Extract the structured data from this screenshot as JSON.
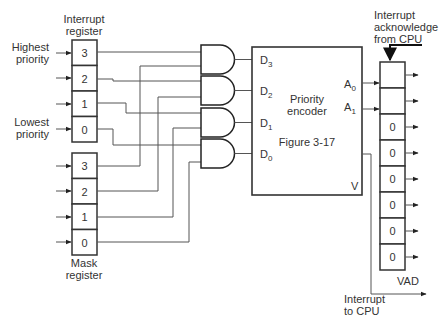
{
  "figure": {
    "caption": "Figure 3-17"
  },
  "interrupt_register": {
    "title_line1": "Interrupt",
    "title_line2": "register",
    "cells": [
      "3",
      "2",
      "1",
      "0"
    ],
    "highest_label_line1": "Highest",
    "highest_label_line2": "priority",
    "lowest_label_line1": "Lowest",
    "lowest_label_line2": "priority"
  },
  "mask_register": {
    "title_line1": "Mask",
    "title_line2": "register",
    "cells": [
      "3",
      "2",
      "1",
      "0"
    ]
  },
  "and_gates": {
    "count": 4
  },
  "priority_encoder": {
    "title_line1": "Priority",
    "title_line2": "encoder",
    "inputs": [
      "D3",
      "D2",
      "D1",
      "D0"
    ],
    "outputs": [
      "A0",
      "A1"
    ],
    "valid_output": "V"
  },
  "vad_register": {
    "label": "VAD",
    "cells": [
      "",
      "",
      "0",
      "0",
      "0",
      "0",
      "0",
      "0"
    ]
  },
  "cpu_signals": {
    "ack_line1": "Interrupt",
    "ack_line2": "acknowledge",
    "ack_line3": "from CPU",
    "int_line1": "Interrupt",
    "int_line2": "to CPU"
  }
}
